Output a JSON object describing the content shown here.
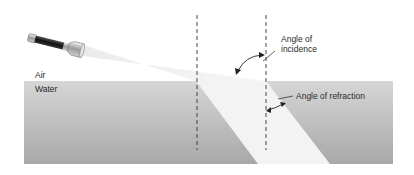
{
  "diagram": {
    "labels": {
      "air": "Air",
      "water": "Water",
      "incidence_line1": "Angle of",
      "incidence_line2": "incidence",
      "refraction": "Angle of refraction"
    },
    "elements": {
      "light_source": "flashlight",
      "normal_lines": 2
    },
    "colors": {
      "water_top": "#d4d4d4",
      "water_bottom": "#a9a9a9",
      "beam": "#f2f2f2",
      "lines": "#333333"
    }
  }
}
